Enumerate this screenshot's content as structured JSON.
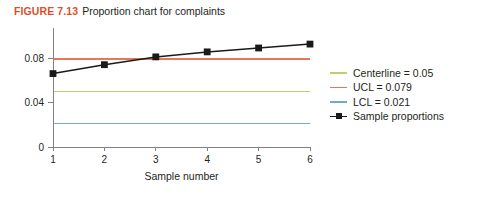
{
  "figure": {
    "label": "FIGURE 7.13",
    "caption": "Proportion chart for complaints",
    "label_color": "#d9512c"
  },
  "chart_data": {
    "type": "line",
    "title": "Proportion chart for complaints",
    "xlabel": "Sample number",
    "ylabel": "",
    "x": [
      1,
      2,
      3,
      4,
      5,
      6
    ],
    "categories": [
      "1",
      "2",
      "3",
      "4",
      "5",
      "6"
    ],
    "xtick_labels": [
      "1",
      "2",
      "3",
      "4",
      "5",
      "6"
    ],
    "ytick_labels": [
      "0",
      "0.04",
      "0.08"
    ],
    "yticks": [
      0,
      0.04,
      0.08
    ],
    "xlim": [
      1,
      6
    ],
    "ylim": [
      0,
      0.1
    ],
    "grid": false,
    "legend_position": "right",
    "series": [
      {
        "name": "Sample proportions",
        "legend_label": "Sample proportions",
        "type": "line-marker",
        "color": "#1a1a1a",
        "marker": "square",
        "values": [
          0.066,
          0.074,
          0.081,
          0.0855,
          0.089,
          0.0925
        ]
      }
    ],
    "reference_lines": [
      {
        "name": "Centerline",
        "legend_label": "Centerline = 0.05",
        "value": 0.05,
        "color": "#c3cc6e"
      },
      {
        "name": "UCL",
        "legend_label": "UCL = 0.079",
        "value": 0.079,
        "color": "#e8765a"
      },
      {
        "name": "LCL",
        "legend_label": "LCL = 0.021",
        "value": 0.021,
        "color": "#7aa5cd"
      }
    ]
  },
  "legend": {
    "items": [
      {
        "label": "Centerline = 0.05",
        "color": "#c3cc6e",
        "marker": false
      },
      {
        "label": "UCL = 0.079",
        "color": "#e8765a",
        "marker": false
      },
      {
        "label": "LCL = 0.021",
        "color": "#7aa5cd",
        "marker": false
      },
      {
        "label": "Sample proportions",
        "color": "#1a1a1a",
        "marker": true
      }
    ]
  }
}
